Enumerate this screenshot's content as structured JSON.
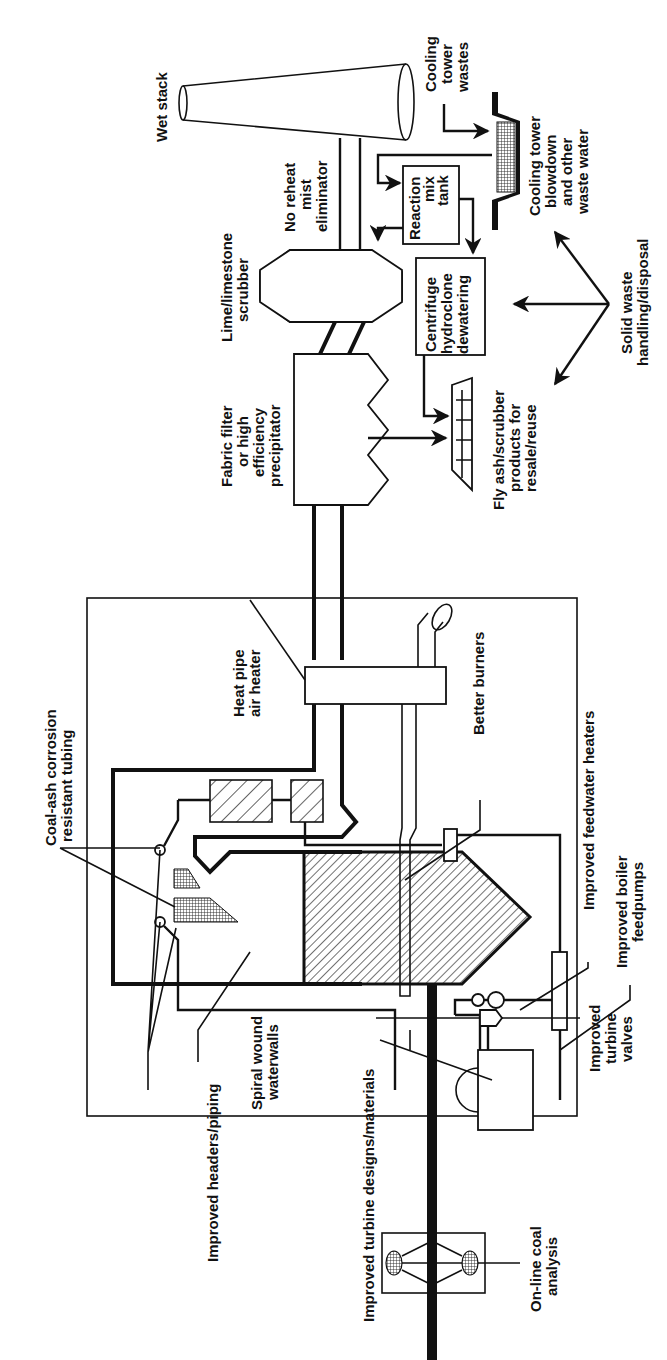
{
  "figure": {
    "orientation": "rotated-90-ccw"
  },
  "labels": {
    "wet_stack": "Wet stack",
    "cooling_tower_wastes": [
      "Cooling",
      "tower",
      "wastes"
    ],
    "no_reheat": [
      "No reheat",
      "mist",
      "eliminator"
    ],
    "reaction_tank": [
      "Reaction",
      "mix",
      "tank"
    ],
    "cooling_blowdown": [
      "Cooling tower",
      "blowdown",
      "and other",
      "waste water"
    ],
    "scrubber": [
      "Lime/limestone",
      "scrubber"
    ],
    "centrifuge": [
      "Centrifuge",
      "hydroclone",
      "dewatering"
    ],
    "solid_waste": [
      "Solid waste",
      "handling/disposal"
    ],
    "fabric_filter": [
      "Fabric filter",
      "or high",
      "efficiency",
      "precipitator"
    ],
    "fly_ash": [
      "Fly ash/scrubber",
      "products for",
      "resale/reuse"
    ],
    "coal_ash": [
      "Coal-ash corrosion",
      "resistant tubing"
    ],
    "heat_pipe": [
      "Heat pipe",
      "air heater"
    ],
    "better_burners": "Better burners",
    "feedwater_heaters": "Improved feedwater heaters",
    "boiler_feedpumps": [
      "Improved boiler",
      "feedpumps"
    ],
    "headers_piping": "Improved headers/piping",
    "spiral_wound": [
      "Spiral wound",
      "waterwalls"
    ],
    "turbine_designs": "Improved turbine designs/materials",
    "turbine_valves": [
      "Improved",
      "turbine",
      "valves"
    ],
    "online_coal": [
      "On-line coal",
      "analysis"
    ]
  }
}
